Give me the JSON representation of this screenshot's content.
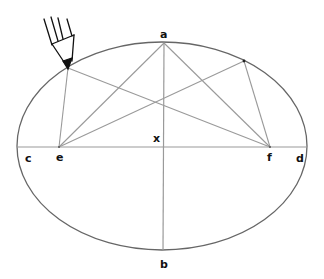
{
  "diagram": {
    "colors": {
      "ellipse_stroke": "#666666",
      "construction_line": "#9a9a9a",
      "pencil": "#111111",
      "label": "#111111"
    },
    "labels": {
      "a": "a",
      "b": "b",
      "c": "c",
      "d": "d",
      "e": "e",
      "f": "f",
      "x": "x"
    },
    "points": {
      "a": [
        164,
        43
      ],
      "b": [
        163,
        250
      ],
      "c": [
        17,
        147
      ],
      "d": [
        307,
        147
      ],
      "e": [
        59,
        147
      ],
      "f": [
        270,
        147
      ],
      "x": [
        162,
        147
      ],
      "pencil_point": [
        68,
        68
      ],
      "second_point": [
        244,
        61
      ]
    },
    "segments": [
      [
        "c",
        "d"
      ],
      [
        "a",
        "b"
      ],
      [
        "a",
        "e"
      ],
      [
        "a",
        "f"
      ],
      [
        "pencil_point",
        "e"
      ],
      [
        "pencil_point",
        "f"
      ],
      [
        "second_point",
        "e"
      ],
      [
        "second_point",
        "f"
      ]
    ],
    "ellipse": {
      "cx": 162,
      "cy": 146,
      "rx": 145,
      "ry": 104
    }
  }
}
